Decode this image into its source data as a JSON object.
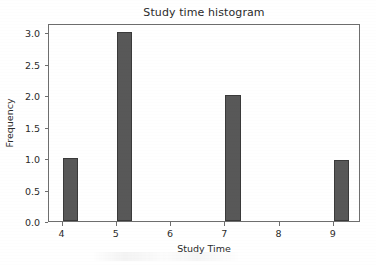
{
  "chart_data": {
    "type": "bar",
    "title": "Study time histogram",
    "xlabel": "Study Time",
    "ylabel": "Frequency",
    "categories": [
      4,
      5,
      6,
      7,
      8,
      9
    ],
    "values": [
      1.0,
      3.0,
      0.0,
      2.0,
      0.0,
      0.97
    ],
    "bars": [
      {
        "x": 4,
        "value": 1.0
      },
      {
        "x": 5,
        "value": 3.0
      },
      {
        "x": 6,
        "value": 0.0
      },
      {
        "x": 7,
        "value": 2.0
      },
      {
        "x": 8,
        "value": 0.0
      },
      {
        "x": 9,
        "value": 0.97
      }
    ],
    "xlim": [
      3.75,
      9.5
    ],
    "ylim": [
      0.0,
      3.15
    ],
    "xticks": [
      "4",
      "5",
      "6",
      "7",
      "8",
      "9"
    ],
    "xtick_values": [
      4,
      5,
      6,
      7,
      8,
      9
    ],
    "yticks": [
      "0.0",
      "0.5",
      "1.0",
      "1.5",
      "2.0",
      "2.5",
      "3.0"
    ],
    "ytick_values": [
      0.0,
      0.5,
      1.0,
      1.5,
      2.0,
      2.5,
      3.0
    ],
    "grid": false,
    "legend": null,
    "bar_color": "#585858",
    "bar_edge_color": "#3a3a3a",
    "axis_color": "#6e6e6e",
    "text_color": "#2b2b2b",
    "background": "#ffffff"
  }
}
